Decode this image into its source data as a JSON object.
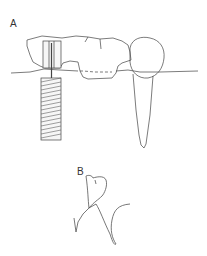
{
  "figure": {
    "panels": [
      {
        "id": "A",
        "label": "A",
        "description": "Implant-supported bridge with screw implant and natural abutment tooth"
      },
      {
        "id": "B",
        "label": "B",
        "description": "Tooth crown with root outline sketch"
      }
    ],
    "colors": {
      "stroke": "#444444",
      "background": "#ffffff",
      "implant_fill": "#f2f2f2"
    }
  }
}
